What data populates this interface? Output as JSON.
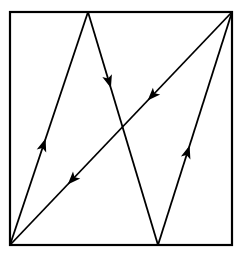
{
  "diagram": {
    "width": 240,
    "height": 257,
    "stroke_color": "#000000",
    "background": "#ffffff",
    "square": {
      "x1": 10,
      "y1": 12,
      "x2": 232,
      "y2": 245
    },
    "vertices": {
      "bottom_left": [
        10,
        245
      ],
      "top_mid": [
        88,
        12
      ],
      "bottom_mid": [
        158,
        245
      ],
      "top_right": [
        232,
        12
      ]
    },
    "path_segments": [
      {
        "name": "segment-bottom-left-to-top",
        "from": [
          10,
          245
        ],
        "to": [
          88,
          12
        ],
        "arrow_at": 0.43
      },
      {
        "name": "segment-top-to-bottom-mid",
        "from": [
          88,
          12
        ],
        "to": [
          158,
          245
        ],
        "arrow_at": 0.3
      },
      {
        "name": "segment-bottom-mid-to-top-right",
        "from": [
          158,
          245
        ],
        "to": [
          232,
          12
        ],
        "arrow_at": 0.4
      },
      {
        "name": "segment-top-right-to-bottom-left-upper",
        "from": [
          232,
          12
        ],
        "to": [
          10,
          245
        ],
        "arrow_at": 0.36
      },
      {
        "name": "segment-top-right-to-bottom-left-lower",
        "from": [
          232,
          12
        ],
        "to": [
          10,
          245
        ],
        "arrow_at": 0.72
      }
    ]
  }
}
